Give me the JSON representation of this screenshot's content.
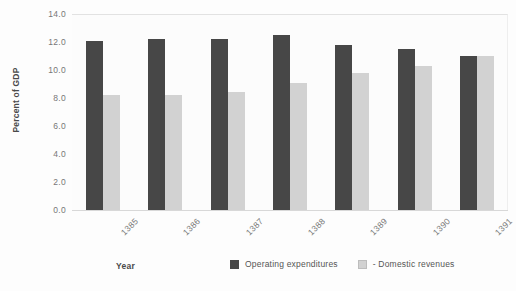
{
  "chart_data": {
    "type": "bar",
    "title": "",
    "xlabel": "Year",
    "ylabel": "Percent of GDP",
    "categories": [
      "1385",
      "1386",
      "1387",
      "1388",
      "1389",
      "1390",
      "1391"
    ],
    "series": [
      {
        "name": "Operating expenditures",
        "color": "#474747",
        "values": [
          12.1,
          12.2,
          12.2,
          12.5,
          11.8,
          11.5,
          11.0
        ]
      },
      {
        "name": "- Domestic revenues",
        "color": "#d2d2d2",
        "values": [
          8.2,
          8.2,
          8.4,
          9.1,
          9.8,
          10.3,
          11.0
        ]
      }
    ],
    "ylim": [
      0.0,
      14.0
    ],
    "ytick_step": 2.0,
    "yticks": [
      "14.0",
      "12.0",
      "10.0",
      "8.0",
      "6.0",
      "4.0",
      "2.0",
      "0.0"
    ],
    "ytick_values": [
      14.0,
      12.0,
      10.0,
      8.0,
      6.0,
      4.0,
      2.0,
      0.0
    ],
    "grid": false,
    "legend_position": "bottom-right",
    "xtick_rotation": -45
  }
}
